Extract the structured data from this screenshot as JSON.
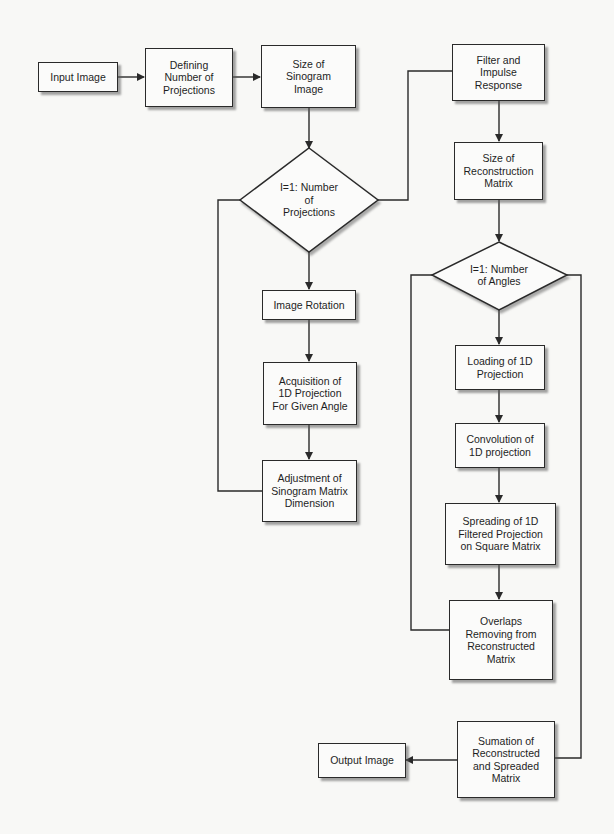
{
  "diagram": {
    "type": "flowchart",
    "colors": {
      "line": "#2a2a2a",
      "box_fill": "#fbfbfa",
      "background": "#f8f8f6"
    },
    "nodes": {
      "input_image": {
        "label": "Input Image",
        "shape": "rectangle"
      },
      "defining_projections": {
        "label": "Defining\nNumber of\nProjections",
        "shape": "rectangle"
      },
      "size_sinogram": {
        "label": "Size of\nSinogram\nImage",
        "shape": "rectangle"
      },
      "filter_impulse": {
        "label": "Filter and\nImpulse\nResponse",
        "shape": "rectangle"
      },
      "loop_projections": {
        "label": "I=1: Number\nof\nProjections",
        "shape": "diamond"
      },
      "image_rotation": {
        "label": "Image Rotation",
        "shape": "rectangle"
      },
      "acquisition": {
        "label": "Acquisition of\n1D Projection\nFor Given Angle",
        "shape": "rectangle"
      },
      "adjustment": {
        "label": "Adjustment of\nSinogram Matrix\nDimension",
        "shape": "rectangle"
      },
      "size_reconstruction": {
        "label": "Size of\nReconstruction\nMatrix",
        "shape": "rectangle"
      },
      "loop_angles": {
        "label": "I=1: Number\nof Angles",
        "shape": "diamond"
      },
      "loading": {
        "label": "Loading of 1D\nProjection",
        "shape": "rectangle"
      },
      "convolution": {
        "label": "Convolution of\n1D projection",
        "shape": "rectangle"
      },
      "spreading": {
        "label": "Spreading of 1D\nFiltered Projection\non Square Matrix",
        "shape": "rectangle"
      },
      "overlaps": {
        "label": "Overlaps\nRemoving from\nReconstructed\nMatrix",
        "shape": "rectangle"
      },
      "sumation": {
        "label": "Sumation of\nReconstructed\nand Spreaded\nMatrix",
        "shape": "rectangle"
      },
      "output_image": {
        "label": "Output Image",
        "shape": "rectangle"
      }
    },
    "edges": [
      [
        "input_image",
        "defining_projections"
      ],
      [
        "defining_projections",
        "size_sinogram"
      ],
      [
        "size_sinogram",
        "loop_projections"
      ],
      [
        "loop_projections",
        "image_rotation"
      ],
      [
        "image_rotation",
        "acquisition"
      ],
      [
        "acquisition",
        "adjustment"
      ],
      [
        "adjustment",
        "loop_projections"
      ],
      [
        "loop_projections",
        "filter_impulse"
      ],
      [
        "filter_impulse",
        "size_reconstruction"
      ],
      [
        "size_reconstruction",
        "loop_angles"
      ],
      [
        "loop_angles",
        "loading"
      ],
      [
        "loading",
        "convolution"
      ],
      [
        "convolution",
        "spreading"
      ],
      [
        "spreading",
        "overlaps"
      ],
      [
        "overlaps",
        "loop_angles"
      ],
      [
        "loop_angles",
        "sumation"
      ],
      [
        "sumation",
        "output_image"
      ]
    ]
  }
}
